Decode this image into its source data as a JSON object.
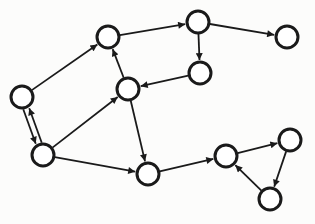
{
  "diagram": {
    "type": "directed-graph",
    "style": {
      "stroke": "#1a1a1a",
      "node_fill": "#ffffff",
      "background": "#fcfcfb",
      "node_radius": 11
    },
    "nodes": [
      {
        "id": "A",
        "x": 22,
        "y": 97
      },
      {
        "id": "B",
        "x": 108,
        "y": 37
      },
      {
        "id": "C",
        "x": 198,
        "y": 22
      },
      {
        "id": "D",
        "x": 287,
        "y": 37
      },
      {
        "id": "E",
        "x": 200,
        "y": 73
      },
      {
        "id": "F",
        "x": 128,
        "y": 89
      },
      {
        "id": "G",
        "x": 43,
        "y": 155
      },
      {
        "id": "H",
        "x": 148,
        "y": 174
      },
      {
        "id": "I",
        "x": 226,
        "y": 156
      },
      {
        "id": "J",
        "x": 290,
        "y": 140
      },
      {
        "id": "K",
        "x": 270,
        "y": 199
      }
    ],
    "edges": [
      {
        "from": "A",
        "to": "B"
      },
      {
        "from": "B",
        "to": "C"
      },
      {
        "from": "C",
        "to": "D"
      },
      {
        "from": "C",
        "to": "E"
      },
      {
        "from": "E",
        "to": "F"
      },
      {
        "from": "F",
        "to": "B"
      },
      {
        "from": "G",
        "to": "F"
      },
      {
        "from": "F",
        "to": "H"
      },
      {
        "from": "G",
        "to": "H"
      },
      {
        "from": "A",
        "to": "G",
        "offset": 3
      },
      {
        "from": "G",
        "to": "A",
        "offset": 3
      },
      {
        "from": "H",
        "to": "I"
      },
      {
        "from": "I",
        "to": "J"
      },
      {
        "from": "J",
        "to": "K"
      },
      {
        "from": "K",
        "to": "I"
      }
    ]
  }
}
